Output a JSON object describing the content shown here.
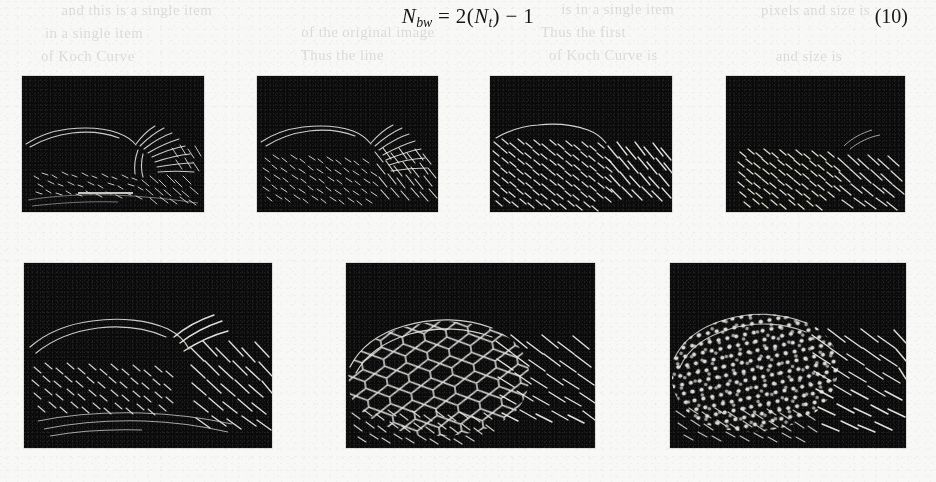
{
  "page": {
    "background_color": "#f8f8f7",
    "ink_color": "#16161a",
    "kind": "scanned-journal-page-fragment"
  },
  "equation": {
    "label": "N",
    "lhs_sub": "bw",
    "rhs_prefix": " = 2(",
    "rhs_var": "N",
    "rhs_sub": "t",
    "rhs_suffix": ") − 1",
    "full_text": "N_bw = 2(N_t) − 1",
    "number": "(10)"
  },
  "bleed_through_text": {
    "note": "faint mirrored ink showing through from the reverse side of the page; illegible",
    "lines": [
      "and this is a single item",
      "in a single item",
      "is in a single item",
      "of the original image",
      "Thus the line",
      "Thus the first",
      "of Koch Curve",
      "of Koch Curve is",
      "pixels and size is",
      "and size is"
    ]
  },
  "figure": {
    "caption": "",
    "panel_background": "#0a0a0a",
    "edge_color": "#e8e8e4",
    "rows": [
      {
        "row": "top",
        "panel_count": 4,
        "panels": [
          {
            "id": "top-1",
            "x": 22,
            "y": 76,
            "w": 182,
            "h": 136,
            "edge_density": "lowest",
            "has_scalebar": true
          },
          {
            "id": "top-2",
            "x": 257,
            "y": 76,
            "w": 181,
            "h": 136,
            "edge_density": "low",
            "has_scalebar": false
          },
          {
            "id": "top-3",
            "x": 490,
            "y": 76,
            "w": 182,
            "h": 136,
            "edge_density": "medium",
            "has_scalebar": false
          },
          {
            "id": "top-4",
            "x": 726,
            "y": 76,
            "w": 179,
            "h": 136,
            "edge_density": "medium-high",
            "has_scalebar": false
          }
        ]
      },
      {
        "row": "bottom",
        "panel_count": 3,
        "panels": [
          {
            "id": "bottom-1",
            "x": 24,
            "y": 263,
            "w": 248,
            "h": 185,
            "edge_density": "high",
            "has_scalebar": false
          },
          {
            "id": "bottom-2",
            "x": 346,
            "y": 263,
            "w": 249,
            "h": 185,
            "edge_density": "higher",
            "has_scalebar": false
          },
          {
            "id": "bottom-3",
            "x": 670,
            "y": 263,
            "w": 236,
            "h": 185,
            "edge_density": "highest",
            "has_scalebar": false
          }
        ]
      }
    ]
  }
}
